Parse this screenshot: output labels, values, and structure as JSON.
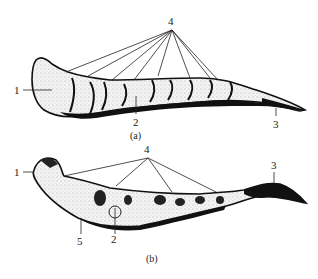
{
  "figure": {
    "panels": [
      {
        "id": "a",
        "caption": "(a)",
        "labels": {
          "l1": "1",
          "l2": "2",
          "l3": "3",
          "l4": "4"
        }
      },
      {
        "id": "b",
        "caption": "(b)",
        "labels": {
          "l1": "1",
          "l2": "2",
          "l3": "3",
          "l4": "4",
          "l5": "5"
        }
      }
    ]
  }
}
